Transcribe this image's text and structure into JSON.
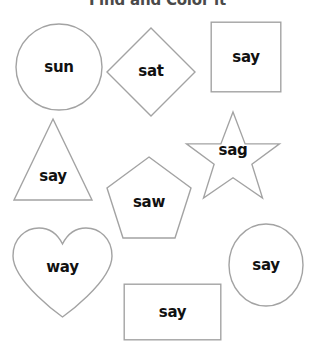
{
  "worksheet": {
    "title": "Find and Color it",
    "title_color": "#4a4a4a",
    "background_color": "#ffffff",
    "outline_color": "#a3a3a3",
    "word_color": "#111111",
    "shapes": [
      {
        "id": "circle-sun",
        "shape": "circle",
        "word": "sun"
      },
      {
        "id": "diamond-sat",
        "shape": "diamond",
        "word": "sat"
      },
      {
        "id": "square-say",
        "shape": "square",
        "word": "say"
      },
      {
        "id": "triangle-say",
        "shape": "triangle",
        "word": "say"
      },
      {
        "id": "star-sag",
        "shape": "star",
        "word": "sag"
      },
      {
        "id": "pentagon-saw",
        "shape": "pentagon",
        "word": "saw"
      },
      {
        "id": "heart-way",
        "shape": "heart",
        "word": "way"
      },
      {
        "id": "oval-say",
        "shape": "oval",
        "word": "say"
      },
      {
        "id": "rectangle-say",
        "shape": "rectangle",
        "word": "say"
      }
    ]
  }
}
